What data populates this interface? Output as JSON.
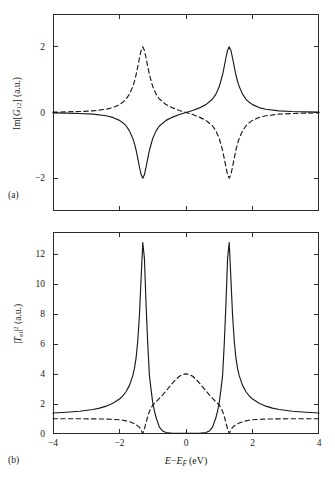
{
  "figure": {
    "panel_a_tag": "(a)",
    "panel_b_tag": "(b)",
    "xlabel_main": "E",
    "xlabel_minus": "−",
    "xlabel_ef": "E",
    "xlabel_ef_sub": "F",
    "xlabel_units": "(eV)",
    "ylabel_a_pre": "Im[",
    "ylabel_a_sym": "G",
    "ylabel_a_sub": "12",
    "ylabel_a_post": "] (a.u.)",
    "ylabel_b_pre": "|",
    "ylabel_b_sym": "T",
    "ylabel_b_sub": "el",
    "ylabel_b_post": "|",
    "ylabel_b_sup": "2",
    "ylabel_b_units": " (a.u.)"
  },
  "chart_data": [
    {
      "type": "line",
      "panel": "(a)",
      "title": "",
      "xlabel": "E − E_F (eV)",
      "ylabel": "Im[G_12] (a.u.)",
      "xlim": [
        -4,
        4
      ],
      "ylim": [
        -3,
        3
      ],
      "xticks": [
        -4,
        -2,
        0,
        2,
        4
      ],
      "xtick_labels": [
        "−4",
        "−2",
        "0",
        "2",
        "4"
      ],
      "yticks": [
        -2,
        0,
        2
      ],
      "ytick_labels": [
        "−2",
        "0",
        "2"
      ],
      "grid": false,
      "legend": null,
      "series": [
        {
          "name": "solid",
          "style": "solid",
          "color": "#1a1a1a",
          "description": "Dispersive lineshape: negative dip of -2 at E-E_F = -1.3, zero crossing at 0, positive peak of +2 at E-E_F = +1.3, decaying to 0 at the edges.",
          "x": [
            -4.0,
            -3.6,
            -3.2,
            -2.8,
            -2.4,
            -2.2,
            -2.0,
            -1.9,
            -1.8,
            -1.7,
            -1.6,
            -1.55,
            -1.5,
            -1.45,
            -1.4,
            -1.35,
            -1.3,
            -1.25,
            -1.2,
            -1.15,
            -1.1,
            -1.0,
            -0.9,
            -0.8,
            -0.6,
            -0.4,
            -0.2,
            0.0,
            0.2,
            0.4,
            0.6,
            0.8,
            0.9,
            1.0,
            1.1,
            1.15,
            1.2,
            1.25,
            1.3,
            1.35,
            1.4,
            1.45,
            1.5,
            1.55,
            1.6,
            1.7,
            1.8,
            1.9,
            2.0,
            2.2,
            2.4,
            2.8,
            3.2,
            3.6,
            4.0
          ],
          "y": [
            -0.01,
            -0.02,
            -0.03,
            -0.05,
            -0.1,
            -0.15,
            -0.24,
            -0.31,
            -0.41,
            -0.56,
            -0.79,
            -0.95,
            -1.15,
            -1.4,
            -1.66,
            -1.89,
            -2.0,
            -1.89,
            -1.66,
            -1.4,
            -1.15,
            -0.79,
            -0.56,
            -0.41,
            -0.24,
            -0.14,
            -0.06,
            0.0,
            0.06,
            0.14,
            0.24,
            0.41,
            0.56,
            0.79,
            1.15,
            1.4,
            1.66,
            1.89,
            2.0,
            1.89,
            1.66,
            1.4,
            1.15,
            0.95,
            0.79,
            0.56,
            0.41,
            0.31,
            0.24,
            0.15,
            0.1,
            0.05,
            0.03,
            0.02,
            0.01
          ]
        },
        {
          "name": "dashed",
          "style": "dashed",
          "color": "#1a1a1a",
          "description": "Mirror image of the solid curve: positive peak of +2 at E-E_F = -1.3 and negative dip of -2 at E-E_F = +1.3.",
          "x": [
            -4.0,
            -3.6,
            -3.2,
            -2.8,
            -2.4,
            -2.2,
            -2.0,
            -1.9,
            -1.8,
            -1.7,
            -1.6,
            -1.55,
            -1.5,
            -1.45,
            -1.4,
            -1.35,
            -1.3,
            -1.25,
            -1.2,
            -1.15,
            -1.1,
            -1.0,
            -0.9,
            -0.8,
            -0.6,
            -0.4,
            -0.2,
            0.0,
            0.2,
            0.4,
            0.6,
            0.8,
            0.9,
            1.0,
            1.1,
            1.15,
            1.2,
            1.25,
            1.3,
            1.35,
            1.4,
            1.45,
            1.5,
            1.55,
            1.6,
            1.7,
            1.8,
            1.9,
            2.0,
            2.2,
            2.4,
            2.8,
            3.2,
            3.6,
            4.0
          ],
          "y": [
            0.01,
            0.02,
            0.03,
            0.05,
            0.1,
            0.15,
            0.24,
            0.31,
            0.41,
            0.56,
            0.79,
            0.95,
            1.15,
            1.4,
            1.66,
            1.89,
            2.0,
            1.89,
            1.66,
            1.4,
            1.15,
            0.79,
            0.56,
            0.41,
            0.24,
            0.14,
            0.06,
            0.0,
            -0.06,
            -0.14,
            -0.24,
            -0.41,
            -0.56,
            -0.79,
            -1.15,
            -1.4,
            -1.66,
            -1.89,
            -2.0,
            -1.89,
            -1.66,
            -1.4,
            -1.15,
            -0.95,
            -0.79,
            -0.56,
            -0.41,
            -0.31,
            -0.24,
            -0.15,
            -0.1,
            -0.05,
            -0.03,
            -0.02,
            -0.01
          ]
        }
      ]
    },
    {
      "type": "line",
      "panel": "(b)",
      "title": "",
      "xlabel": "E − E_F (eV)",
      "ylabel": "|T_el|^2 (a.u.)",
      "xlim": [
        -4,
        4
      ],
      "ylim": [
        0,
        13.5
      ],
      "xticks": [
        -4,
        -2,
        0,
        2,
        4
      ],
      "xtick_labels": [
        "−4",
        "−2",
        "0",
        "2",
        "4"
      ],
      "yticks": [
        0,
        2,
        4,
        6,
        8,
        10,
        12
      ],
      "ytick_labels": [
        "0",
        "2",
        "4",
        "6",
        "8",
        "10",
        "12"
      ],
      "grid": false,
      "legend": null,
      "series": [
        {
          "name": "solid",
          "style": "solid",
          "color": "#1a1a1a",
          "description": "Two sharp resonance peaks reaching about 12.8 at E-E_F = ±1.3, baseline about 1.4 at the edges, dropping to nearly 0 between the peaks.",
          "x": [
            -4.0,
            -3.6,
            -3.2,
            -2.8,
            -2.6,
            -2.4,
            -2.2,
            -2.0,
            -1.9,
            -1.8,
            -1.7,
            -1.6,
            -1.55,
            -1.5,
            -1.45,
            -1.4,
            -1.35,
            -1.3,
            -1.25,
            -1.2,
            -1.15,
            -1.1,
            -1.05,
            -1.0,
            -0.95,
            -0.9,
            -0.8,
            -0.7,
            -0.6,
            -0.4,
            -0.2,
            0.0,
            0.2,
            0.4,
            0.6,
            0.7,
            0.8,
            0.9,
            0.95,
            1.0,
            1.05,
            1.1,
            1.15,
            1.2,
            1.25,
            1.3,
            1.35,
            1.4,
            1.45,
            1.5,
            1.55,
            1.6,
            1.7,
            1.8,
            1.9,
            2.0,
            2.2,
            2.4,
            2.6,
            2.8,
            3.2,
            3.6,
            4.0
          ],
          "y": [
            1.4,
            1.45,
            1.52,
            1.64,
            1.73,
            1.86,
            2.05,
            2.34,
            2.55,
            2.84,
            3.25,
            3.9,
            4.38,
            5.1,
            6.25,
            7.95,
            10.4,
            12.8,
            11.7,
            8.6,
            6.0,
            3.9,
            2.95,
            2.1,
            1.55,
            1.1,
            0.46,
            0.2,
            0.1,
            0.03,
            0.01,
            0.0,
            0.01,
            0.03,
            0.1,
            0.2,
            0.46,
            1.1,
            1.55,
            2.1,
            2.95,
            3.9,
            6.0,
            8.6,
            11.7,
            12.8,
            10.4,
            7.95,
            6.25,
            5.1,
            4.38,
            3.9,
            3.25,
            2.84,
            2.55,
            2.34,
            2.05,
            1.86,
            1.73,
            1.64,
            1.52,
            1.45,
            1.4
          ]
        },
        {
          "name": "dashed",
          "style": "dashed",
          "color": "#1a1a1a",
          "description": "Broad central bump peaking at 4.0 at E-E_F = 0, falling to 0 at E-E_F = ±1.3, with a flat baseline near 1.0 outside.",
          "x": [
            -4.0,
            -3.6,
            -3.2,
            -2.8,
            -2.4,
            -2.2,
            -2.0,
            -1.9,
            -1.8,
            -1.7,
            -1.6,
            -1.5,
            -1.45,
            -1.4,
            -1.35,
            -1.3,
            -1.25,
            -1.2,
            -1.15,
            -1.1,
            -1.0,
            -0.9,
            -0.8,
            -0.7,
            -0.6,
            -0.5,
            -0.4,
            -0.3,
            -0.2,
            -0.1,
            0.0,
            0.1,
            0.2,
            0.3,
            0.4,
            0.5,
            0.6,
            0.7,
            0.8,
            0.9,
            1.0,
            1.1,
            1.15,
            1.2,
            1.25,
            1.3,
            1.35,
            1.4,
            1.45,
            1.5,
            1.6,
            1.7,
            1.8,
            1.9,
            2.0,
            2.2,
            2.4,
            2.8,
            3.2,
            3.6,
            4.0
          ],
          "y": [
            1.02,
            1.02,
            1.02,
            1.01,
            1.0,
            0.98,
            0.95,
            0.92,
            0.88,
            0.82,
            0.74,
            0.62,
            0.54,
            0.44,
            0.28,
            0.02,
            0.34,
            0.78,
            1.18,
            1.52,
            1.94,
            2.15,
            2.38,
            2.62,
            2.88,
            3.15,
            3.42,
            3.66,
            3.86,
            3.98,
            4.02,
            3.98,
            3.86,
            3.66,
            3.42,
            3.15,
            2.88,
            2.62,
            2.38,
            2.15,
            1.94,
            1.52,
            1.18,
            0.78,
            0.34,
            0.02,
            0.28,
            0.44,
            0.54,
            0.62,
            0.74,
            0.82,
            0.88,
            0.92,
            0.95,
            0.98,
            1.0,
            1.01,
            1.02,
            1.02,
            1.02
          ]
        }
      ]
    }
  ]
}
